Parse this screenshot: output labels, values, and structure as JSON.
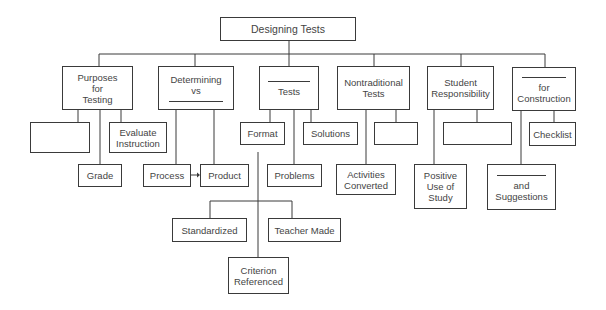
{
  "diagram": {
    "title": "Designing Tests",
    "line_color": "#3a3a3a",
    "nodes": {
      "root": {
        "label": "Designing Tests"
      },
      "purposes": {
        "label": "Purposes\nfor\nTesting"
      },
      "purposes_blank": {
        "label": ""
      },
      "evaluate": {
        "label": "Evaluate\nInstruction"
      },
      "grade": {
        "label": "Grade"
      },
      "determining": {
        "label": "Determining\nvs",
        "blank_after": true
      },
      "process": {
        "label": "Process"
      },
      "product": {
        "label": "Product"
      },
      "tests": {
        "label": "Tests",
        "blank_before": true
      },
      "format": {
        "label": "Format"
      },
      "solutions": {
        "label": "Solutions"
      },
      "problems": {
        "label": "Problems"
      },
      "standardized": {
        "label": "Standardized"
      },
      "teacher_made": {
        "label": "Teacher Made"
      },
      "criterion": {
        "label": "Criterion\nReferenced"
      },
      "nontraditional": {
        "label": "Nontraditional\nTests"
      },
      "nontraditional_blank": {
        "label": ""
      },
      "activities": {
        "label": "Activities\nConverted"
      },
      "student": {
        "label": "Student\nResponsibility"
      },
      "student_blank": {
        "label": ""
      },
      "positive": {
        "label": "Positive\nUse of\nStudy"
      },
      "construction": {
        "label": "for\nConstruction",
        "blank_before": true
      },
      "checklist": {
        "label": "Checklist"
      },
      "suggestions": {
        "label": "and\nSuggestions",
        "blank_before": true
      }
    },
    "edges": [
      [
        "root",
        "purposes"
      ],
      [
        "root",
        "determining"
      ],
      [
        "root",
        "tests"
      ],
      [
        "root",
        "nontraditional"
      ],
      [
        "root",
        "student"
      ],
      [
        "root",
        "construction"
      ],
      [
        "purposes",
        "purposes_blank"
      ],
      [
        "purposes",
        "evaluate"
      ],
      [
        "purposes",
        "grade"
      ],
      [
        "determining",
        "process"
      ],
      [
        "determining",
        "product"
      ],
      [
        "process",
        "product"
      ],
      [
        "tests",
        "format"
      ],
      [
        "tests",
        "solutions"
      ],
      [
        "tests",
        "problems"
      ],
      [
        "format",
        "standardized"
      ],
      [
        "format",
        "teacher_made"
      ],
      [
        "format",
        "criterion"
      ],
      [
        "nontraditional",
        "nontraditional_blank"
      ],
      [
        "nontraditional",
        "activities"
      ],
      [
        "student",
        "student_blank"
      ],
      [
        "student",
        "positive"
      ],
      [
        "construction",
        "checklist"
      ],
      [
        "construction",
        "suggestions"
      ]
    ]
  }
}
